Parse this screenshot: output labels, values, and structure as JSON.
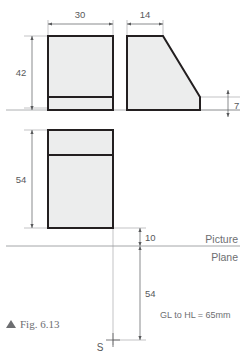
{
  "figure": {
    "caption_marker": "triangle-up-icon",
    "caption": "Fig. 6.13",
    "note": "GL to HL = 65mm",
    "picture_label": "Picture",
    "plane_label": "Plane",
    "station_point": "S"
  },
  "dimensions": {
    "front_width": "30",
    "side_width": "14",
    "front_height": "42",
    "right_small": "7",
    "plan_depth": "54",
    "pp_offset": "10",
    "sp_distance": "54"
  },
  "colors": {
    "outline": "#231f20",
    "fill": "#eceded",
    "thin": "#8a8c8e",
    "text": "#6d6e71",
    "caption": "#6d6e71"
  }
}
